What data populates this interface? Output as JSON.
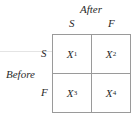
{
  "diagram": {
    "column_title": "After",
    "row_title": "Before",
    "column_headers": [
      "S",
      "F"
    ],
    "row_headers": [
      "S",
      "F"
    ],
    "cells": [
      {
        "var": "X",
        "sub": "1"
      },
      {
        "var": "X",
        "sub": "2"
      },
      {
        "var": "X",
        "sub": "3"
      },
      {
        "var": "X",
        "sub": "4"
      }
    ]
  }
}
